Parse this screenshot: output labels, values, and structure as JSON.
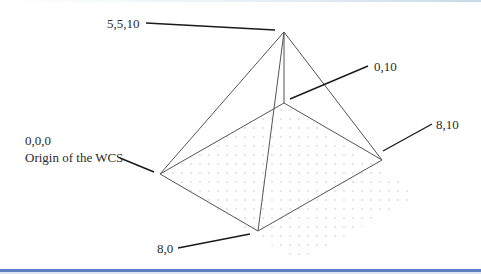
{
  "diagram": {
    "type": "pyramid-wcs-illustration",
    "labels": {
      "apex": "5,5,10",
      "back_corner": "0,10",
      "right_corner": "8,10",
      "origin_coords": "0,0,0",
      "origin_caption": "Origin of the WCS",
      "front_corner": "8,0"
    },
    "vertices_px": {
      "apex": [
        284,
        32
      ],
      "origin": [
        160,
        174
      ],
      "back": [
        284,
        103
      ],
      "right": [
        382,
        160
      ],
      "front": [
        258,
        231
      ]
    },
    "grid_region_px": [
      [
        160,
        174
      ],
      [
        284,
        103
      ],
      [
        420,
        195
      ],
      [
        298,
        262
      ]
    ],
    "colors": {
      "edge": "#555555",
      "leader": "#1a1a1a",
      "grid_dot": "#b8b8b8",
      "text": "#2b2b2b",
      "bottom_rule": "#5b7fc0"
    }
  }
}
